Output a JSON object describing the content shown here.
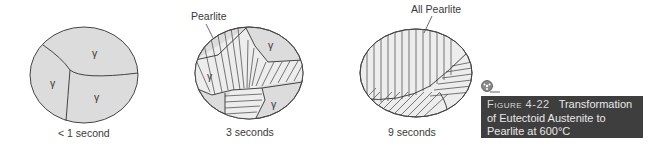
{
  "panels": [
    {
      "time_label": "< 1 second",
      "grain_labels": [
        "γ",
        "γ",
        "γ"
      ]
    },
    {
      "time_label": "3 seconds",
      "callout": "Pearlite",
      "grain_labels": [
        "γ",
        "γ",
        "γ"
      ]
    },
    {
      "time_label": "9 seconds",
      "callout": "All Pearlite"
    }
  ],
  "caption": {
    "figure_number": "Figure 4-22",
    "text_line1": "Transformation",
    "text_line2": "of Eutectoid Austenite to",
    "text_line3": "Pearlite at 600°C"
  },
  "colors": {
    "austenite_fill": "#dcdcdc",
    "pearlite_fill": "#ededed",
    "outline": "#444444",
    "caption_bg": "#3e3e3e"
  }
}
